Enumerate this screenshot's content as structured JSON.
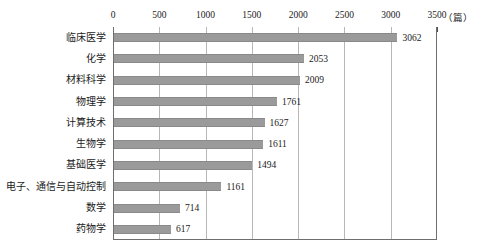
{
  "chart_data": {
    "type": "bar",
    "orientation": "horizontal",
    "title": "",
    "subtitle": "",
    "xlabel": "（篇）",
    "ylabel": "",
    "xlim": [
      0,
      3500
    ],
    "xticks": [
      "0",
      "500",
      "1000",
      "1500",
      "2000",
      "2500",
      "3000",
      "3500"
    ],
    "xtick_values": [
      0,
      500,
      1000,
      1500,
      2000,
      2500,
      3000,
      3500
    ],
    "grid": true,
    "grid_axis": "x",
    "legend": false,
    "axis_position": "top",
    "bar_color": "#9a9a9a",
    "categories": [
      "临床医学",
      "化学",
      "材料科学",
      "物理学",
      "计算技术",
      "生物学",
      "基础医学",
      "电子、通信与自动控制",
      "数学",
      "药物学"
    ],
    "values": [
      3062,
      2053,
      2009,
      1761,
      1627,
      1611,
      1494,
      1161,
      714,
      617
    ],
    "value_labels": [
      "3062",
      "2053",
      "2009",
      "1761",
      "1627",
      "1611",
      "1494",
      "1161",
      "714",
      "617"
    ]
  }
}
